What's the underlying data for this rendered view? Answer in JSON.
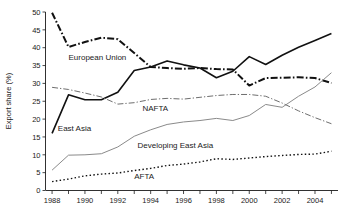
{
  "chart_data": {
    "type": "line",
    "title": "",
    "xlabel": "",
    "ylabel": "Export share (%)",
    "xlim": [
      1987.6,
      2005.4
    ],
    "ylim": [
      0,
      50
    ],
    "yticks": [
      0,
      5,
      10,
      15,
      20,
      25,
      30,
      35,
      40,
      45,
      50
    ],
    "ytick_labels": [
      "0",
      "5",
      "10",
      "15",
      "20",
      "25",
      "30",
      "35",
      "40",
      "45",
      "50"
    ],
    "xticks": [
      1988,
      1989,
      1990,
      1991,
      1992,
      1993,
      1994,
      1995,
      1996,
      1997,
      1998,
      1999,
      2000,
      2001,
      2002,
      2003,
      2004,
      2005
    ],
    "xtick_labels_shown": [
      "1988",
      "1990",
      "1992",
      "1994",
      "1996",
      "1998",
      "2000",
      "2002",
      "2004"
    ],
    "grid": false,
    "legend_position": "inline-annotations",
    "x": [
      1988,
      1989,
      1990,
      1991,
      1992,
      1993,
      1994,
      1995,
      1996,
      1997,
      1998,
      1999,
      2000,
      2001,
      2002,
      2003,
      2004,
      2005
    ],
    "series": [
      {
        "name": "European Union",
        "style": "dash-dot-thick",
        "color": "#111111",
        "label_x": 1989.0,
        "label_y": 36.5,
        "values": [
          49.8,
          40.2,
          41.6,
          42.8,
          42.4,
          38.5,
          34.6,
          34.3,
          34.1,
          34.3,
          34.0,
          33.9,
          29.4,
          31.5,
          31.6,
          31.7,
          31.5,
          30.1
        ]
      },
      {
        "name": "East Asia",
        "style": "solid-thick",
        "color": "#111111",
        "label_x": 1988.35,
        "label_y": 16.8,
        "values": [
          16.0,
          26.8,
          25.4,
          25.4,
          27.5,
          33.6,
          34.6,
          36.3,
          35.2,
          34.3,
          31.6,
          33.4,
          37.5,
          35.3,
          37.9,
          40.1,
          42.0,
          44.0
        ]
      },
      {
        "name": "NAFTA",
        "style": "dash-dot-thin",
        "color": "#6e6e6e",
        "label_x": 1993.5,
        "label_y": 22.3,
        "values": [
          28.9,
          28.3,
          27.3,
          26.2,
          24.2,
          24.6,
          25.5,
          25.8,
          25.6,
          26.1,
          26.6,
          26.9,
          26.9,
          26.4,
          24.5,
          22.3,
          20.4,
          18.7
        ]
      },
      {
        "name": "Developing East Asia",
        "style": "solid-thin",
        "color": "#8a8a8a",
        "label_x": 1993.2,
        "label_y": 12.0,
        "values": [
          5.7,
          9.9,
          10.0,
          10.3,
          12.2,
          15.2,
          17.0,
          18.5,
          19.2,
          19.6,
          20.2,
          19.6,
          21.0,
          24.1,
          23.3,
          26.4,
          29.0,
          33.0
        ]
      },
      {
        "name": "AFTA",
        "style": "dotted",
        "color": "#111111",
        "label_x": 1993.0,
        "label_y": 3.2,
        "values": [
          2.5,
          3.2,
          4.1,
          4.6,
          4.9,
          5.6,
          6.2,
          7.0,
          7.4,
          8.0,
          8.9,
          8.7,
          9.1,
          9.5,
          9.8,
          10.1,
          10.2,
          11.0
        ]
      }
    ]
  }
}
